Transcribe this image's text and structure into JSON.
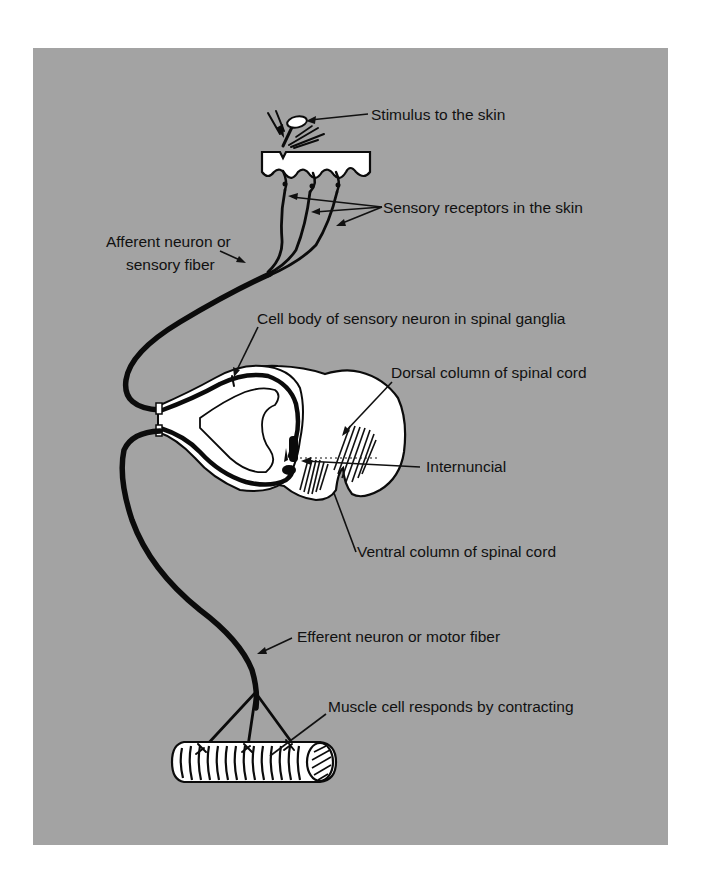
{
  "figure": {
    "type": "diagram",
    "background_color": "#a3a3a3",
    "ink_color": "#0b0b0b",
    "tissue_color": "#ffffff"
  },
  "labels": {
    "stimulus": "Stimulus to the skin",
    "receptors": "Sensory receptors in the skin",
    "afferent_line1": "Afferent neuron or",
    "afferent_line2": "sensory fiber",
    "cell_body": "Cell body of sensory neuron in spinal ganglia",
    "dorsal": "Dorsal column of spinal cord",
    "internuncial": "Internuncial",
    "ventral": "Ventral column of spinal cord",
    "efferent": "Efferent neuron or motor fiber",
    "muscle": "Muscle cell responds by contracting"
  },
  "structures": [
    {
      "name": "skin",
      "label_key": "stimulus"
    },
    {
      "name": "sensory-receptors",
      "count": 3
    },
    {
      "name": "afferent-fiber"
    },
    {
      "name": "spinal-ganglion"
    },
    {
      "name": "spinal-cord-cross-section"
    },
    {
      "name": "internuncial-neuron"
    },
    {
      "name": "efferent-fiber"
    },
    {
      "name": "muscle-cell"
    }
  ]
}
